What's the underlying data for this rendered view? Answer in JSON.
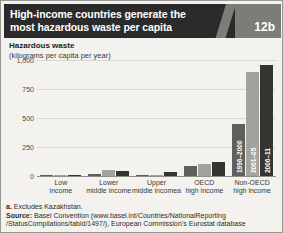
{
  "header": {
    "title_line1": "High-income countries generate the",
    "title_line2": "most hazardous waste per capita",
    "figure_number": "12b"
  },
  "chart_data": {
    "type": "bar",
    "title": "Hazardous waste",
    "subtitle": "(kilograms per capita per year)",
    "ylabel": "",
    "xlabel": "",
    "ylim": [
      0,
      1000
    ],
    "yticks": [
      "0",
      "250",
      "500",
      "750",
      "1,000"
    ],
    "ytick_values": [
      0,
      250,
      500,
      750,
      1000
    ],
    "grid": true,
    "legend_position": "in-bars",
    "categories": [
      "Low income",
      "Lower middle income",
      "Upper middle income",
      "OECD high income",
      "Non-OECD high income"
    ],
    "category_lines": [
      [
        "Low",
        "income"
      ],
      [
        "Lower",
        "middle income"
      ],
      [
        "Upper",
        "middle income",
        "a"
      ],
      [
        "OECD",
        "high income"
      ],
      [
        "Non-OECD",
        "high income"
      ]
    ],
    "series": [
      {
        "name": "1996–2000",
        "color": "#5f5f5b",
        "values": [
          3,
          20,
          10,
          85,
          450
        ]
      },
      {
        "name": "2001–05",
        "color": "#a3a39e",
        "values": [
          4,
          55,
          8,
          105,
          900
        ]
      },
      {
        "name": "2006–11",
        "color": "#35352f",
        "values": [
          6,
          40,
          35,
          120,
          960
        ]
      }
    ]
  },
  "footer": {
    "note_marker": "a.",
    "note_text": "Excludes Kazakhstan.",
    "source_label": "Source:",
    "source_line1": "Basel Convention (www.basel.int/Countries/NationalReporting",
    "source_line2": "/StatusCompilations/tabid/1497/), European Commission’s Eurostat database"
  }
}
